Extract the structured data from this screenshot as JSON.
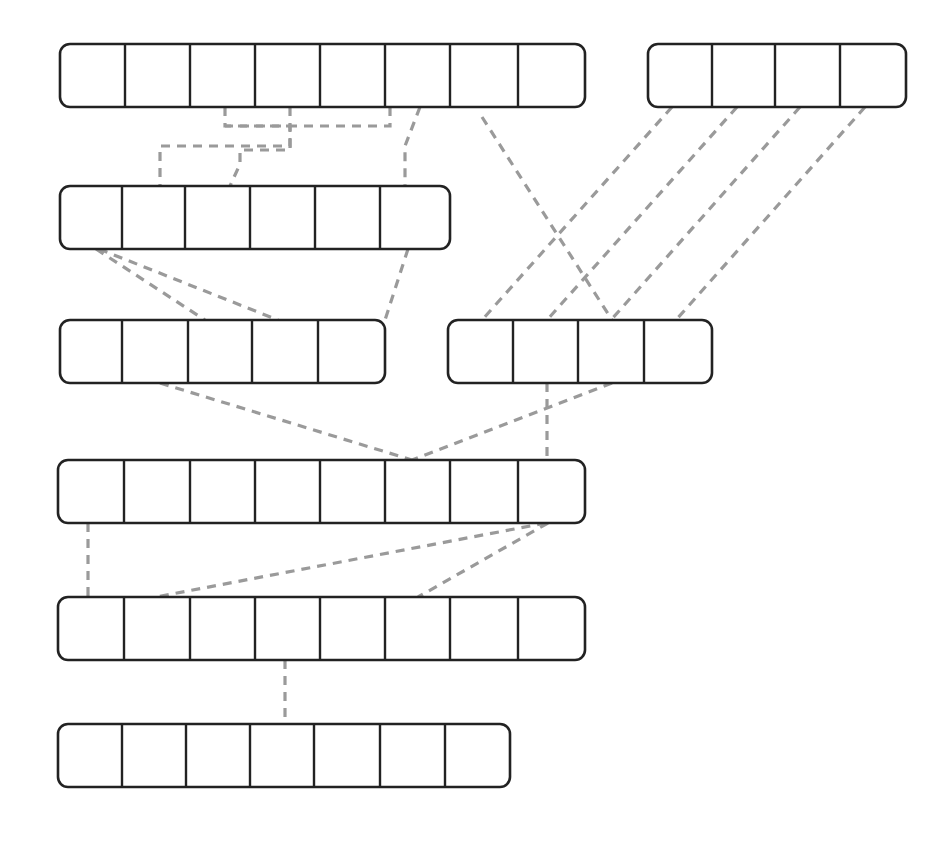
{
  "diagram": {
    "type": "node-link-track-diagram",
    "canvas": {
      "width": 952,
      "height": 841
    },
    "style": {
      "background_color": "#ffffff",
      "track_stroke_color": "#222222",
      "track_fill_color": "#ffffff",
      "track_stroke_width": 2.6,
      "divider_stroke_width": 2.4,
      "link_color": "#9a9a9a",
      "link_stroke_width": 3.2,
      "link_dash": "9 7",
      "corner_radius": 10
    },
    "rows": [
      {
        "id": "row-1",
        "label": "row-1",
        "cell_count": 8,
        "x": 60,
        "y": 44,
        "width": 525,
        "height": 63,
        "cell_boundaries": [
          125,
          190,
          255,
          320,
          385,
          450,
          518
        ]
      },
      {
        "id": "row-1b",
        "label": "row-1b",
        "cell_count": 4,
        "x": 648,
        "y": 44,
        "width": 258,
        "height": 63,
        "cell_boundaries": [
          712,
          775,
          840
        ]
      },
      {
        "id": "row-2",
        "label": "row-2",
        "cell_count": 6,
        "x": 60,
        "y": 186,
        "width": 390,
        "height": 63,
        "cell_boundaries": [
          122,
          185,
          250,
          315,
          380
        ]
      },
      {
        "id": "row-3a",
        "label": "row-3a",
        "cell_count": 5,
        "x": 60,
        "y": 320,
        "width": 325,
        "height": 63,
        "cell_boundaries": [
          122,
          188,
          252,
          318
        ]
      },
      {
        "id": "row-3b",
        "label": "row-3b",
        "cell_count": 4,
        "x": 448,
        "y": 320,
        "width": 264,
        "height": 63,
        "cell_boundaries": [
          513,
          578,
          644
        ]
      },
      {
        "id": "row-4",
        "label": "row-4",
        "cell_count": 8,
        "x": 58,
        "y": 460,
        "width": 527,
        "height": 63,
        "cell_boundaries": [
          124,
          190,
          255,
          320,
          385,
          450,
          518
        ]
      },
      {
        "id": "row-5",
        "label": "row-5",
        "cell_count": 8,
        "x": 58,
        "y": 597,
        "width": 527,
        "height": 63,
        "cell_boundaries": [
          124,
          190,
          255,
          320,
          385,
          450,
          518
        ]
      },
      {
        "id": "row-6",
        "label": "row-6",
        "cell_count": 7,
        "x": 58,
        "y": 724,
        "width": 452,
        "height": 63,
        "cell_boundaries": [
          122,
          186,
          250,
          314,
          380,
          445
        ]
      }
    ],
    "links": [
      {
        "id": "link-1",
        "from_row": "row-1",
        "to_row": "row-2",
        "points": "225,107 225,126 290,126 290,146 160,146 160,186"
      },
      {
        "id": "link-2",
        "from_row": "row-1",
        "to_row": "row-2",
        "points": "290,107 290,150 240,150 240,164 230,186"
      },
      {
        "id": "link-3",
        "from_row": "row-1",
        "to_row": "row-2",
        "points": "390,107 390,126 225,126"
      },
      {
        "id": "link-4",
        "from_row": "row-1",
        "to_row": "row-2",
        "points": "420,107 405,146 405,186"
      },
      {
        "id": "link-5",
        "from_row": "row-1",
        "to_row": "row-3b",
        "points": "482,117 612,320"
      },
      {
        "id": "link-6",
        "from_row": "row-1b",
        "to_row": "row-3b",
        "points": "672,107 482,320"
      },
      {
        "id": "link-7",
        "from_row": "row-1b",
        "to_row": "row-3b",
        "points": "737,107 547,320"
      },
      {
        "id": "link-8",
        "from_row": "row-1b",
        "to_row": "row-3b",
        "points": "800,107 611,320"
      },
      {
        "id": "link-9",
        "from_row": "row-1b",
        "to_row": "row-3b",
        "points": "865,107 676,320"
      },
      {
        "id": "link-10",
        "from_row": "row-2",
        "to_row": "row-3a",
        "points": "96,249 205,320"
      },
      {
        "id": "link-11",
        "from_row": "row-2",
        "to_row": "row-3a",
        "points": "99,249 278,320"
      },
      {
        "id": "link-12",
        "from_row": "row-2",
        "to_row": "row-3a",
        "points": "408,249 385,320"
      },
      {
        "id": "link-13",
        "from_row": "row-3a",
        "to_row": "row-4",
        "points": "160,383 412,460"
      },
      {
        "id": "link-14",
        "from_row": "row-3b",
        "to_row": "row-4",
        "points": "612,383 412,460"
      },
      {
        "id": "link-15",
        "from_row": "row-3b",
        "to_row": "row-4",
        "points": "547,383 547,460"
      },
      {
        "id": "link-16",
        "from_row": "row-4",
        "to_row": "row-5",
        "points": "88,523 88,597"
      },
      {
        "id": "link-17",
        "from_row": "row-4",
        "to_row": "row-5",
        "points": "546,523 156,597"
      },
      {
        "id": "link-18",
        "from_row": "row-4",
        "to_row": "row-5",
        "points": "548,523 418,597"
      },
      {
        "id": "link-19",
        "from_row": "row-5",
        "to_row": "row-6",
        "points": "285,660 285,724"
      }
    ]
  }
}
